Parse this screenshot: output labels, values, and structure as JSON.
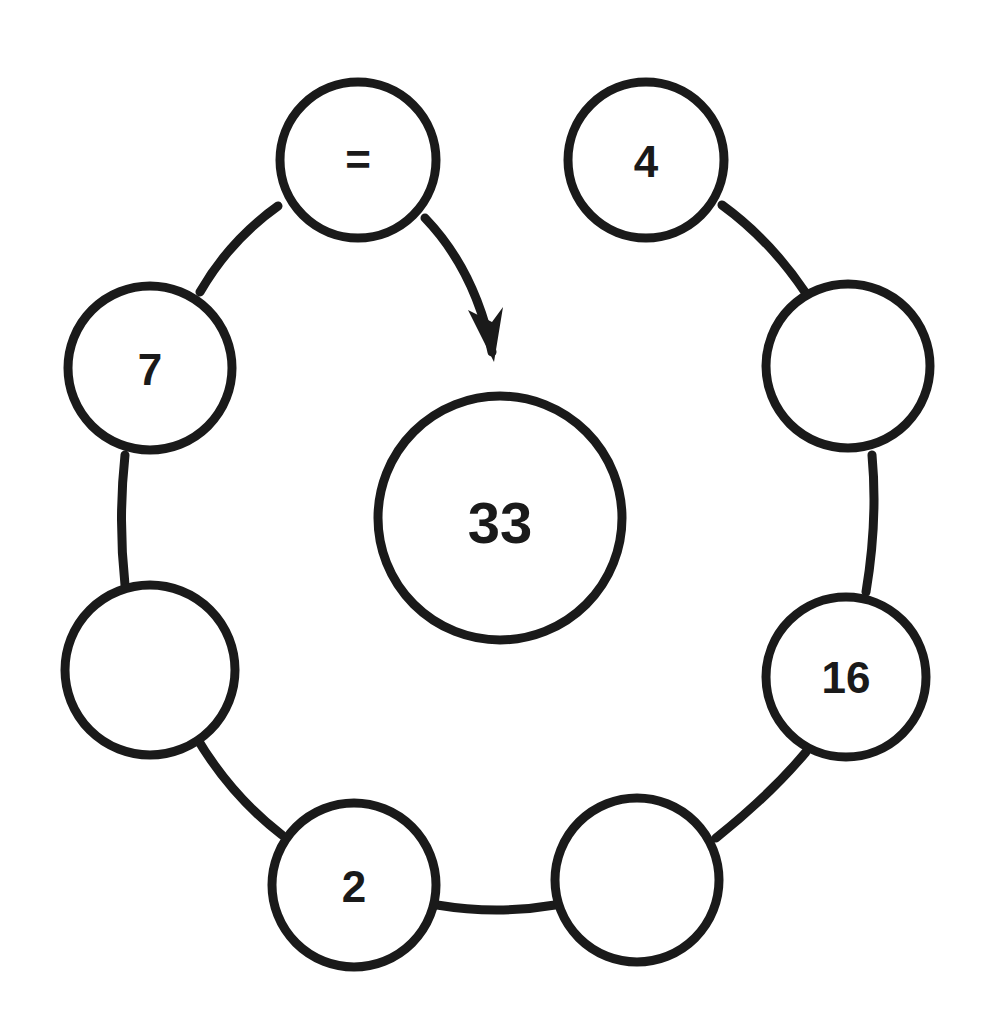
{
  "diagram": {
    "type": "number-circle-puzzle",
    "center": {
      "value": "33",
      "x": 500,
      "y": 518,
      "r": 122
    },
    "nodes": [
      {
        "id": "equals",
        "value": "=",
        "x": 358,
        "y": 160
      },
      {
        "id": "top-right",
        "value": "4",
        "x": 646,
        "y": 160
      },
      {
        "id": "right-upper",
        "value": "",
        "x": 848,
        "y": 366
      },
      {
        "id": "right-lower",
        "value": "16",
        "x": 846,
        "y": 677
      },
      {
        "id": "bottom-right",
        "value": "",
        "x": 637,
        "y": 880
      },
      {
        "id": "bottom-left",
        "value": "2",
        "x": 354,
        "y": 885
      },
      {
        "id": "left-lower",
        "value": "",
        "x": 150,
        "y": 670
      },
      {
        "id": "left-upper",
        "value": "7",
        "x": 150,
        "y": 368
      }
    ],
    "node_radius": 80,
    "stroke_color": "#1a1a1a",
    "arrow": {
      "from": "equals",
      "to": "center"
    }
  }
}
